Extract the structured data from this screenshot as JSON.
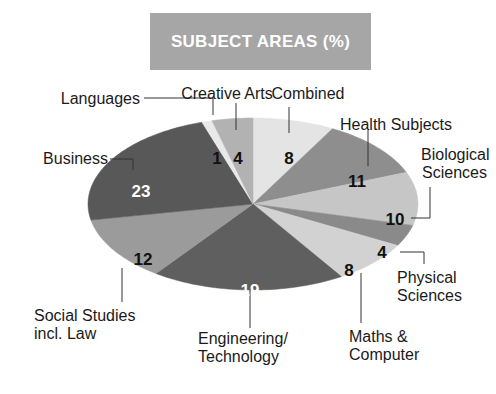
{
  "title": "SUBJECT AREAS (%)",
  "chart_data": {
    "type": "pie",
    "title": "SUBJECT AREAS (%)",
    "unit": "%",
    "start_angle": "12 o'clock",
    "direction": "clockwise",
    "slices": [
      {
        "label": "Combined",
        "value": 8,
        "color": "#e4e4e4",
        "value_color": "#111111"
      },
      {
        "label": "Health Subjects",
        "value": 11,
        "color": "#8e8e8e",
        "value_color": "#111111"
      },
      {
        "label": "Biological Sciences",
        "value": 10,
        "color": "#c6c6c6",
        "value_color": "#111111"
      },
      {
        "label": "Physical Sciences",
        "value": 4,
        "color": "#8a8a8a",
        "value_color": "#111111"
      },
      {
        "label": "Maths & Computer",
        "value": 8,
        "color": "#d2d2d2",
        "value_color": "#111111"
      },
      {
        "label": "Engineering/ Technology",
        "value": 19,
        "color": "#5f5f5f",
        "value_color": "#ffffff"
      },
      {
        "label": "Social Studies incl. Law",
        "value": 12,
        "color": "#9b9b9b",
        "value_color": "#111111"
      },
      {
        "label": "Business",
        "value": 23,
        "color": "#585858",
        "value_color": "#ffffff"
      },
      {
        "label": "Languages",
        "value": 1,
        "color": "#e9e9e9",
        "value_color": "#111111"
      },
      {
        "label": "Creative Arts",
        "value": 4,
        "color": "#b2b2b2",
        "value_color": "#111111"
      }
    ],
    "legend": "none (direct callout labels)"
  },
  "labels": {
    "combined": [
      "Combined"
    ],
    "health": [
      "Health Subjects"
    ],
    "biological": [
      "Biological",
      "Sciences"
    ],
    "physical": [
      "Physical",
      "Sciences"
    ],
    "maths": [
      "Maths &",
      "Computer"
    ],
    "engineering": [
      "Engineering/",
      "Technology"
    ],
    "social": [
      "Social Studies",
      "incl. Law"
    ],
    "business": [
      "Business"
    ],
    "languages": [
      "Languages"
    ],
    "creative": [
      "Creative Arts"
    ]
  },
  "values": {
    "combined": "8",
    "health": "11",
    "biological": "10",
    "physical": "4",
    "maths": "8",
    "engineering": "19",
    "social": "12",
    "business": "23",
    "languages": "1",
    "creative": "4"
  }
}
